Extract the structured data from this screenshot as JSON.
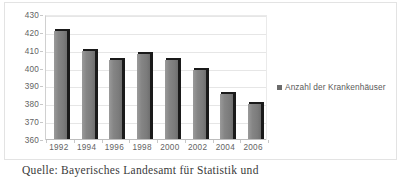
{
  "chart_data": {
    "type": "bar",
    "title": "",
    "xlabel": "",
    "ylabel": "",
    "categories": [
      "1992",
      "1994",
      "1996",
      "1998",
      "2000",
      "2002",
      "2004",
      "2006"
    ],
    "values": [
      421,
      410,
      405,
      408,
      405,
      399,
      386,
      380
    ],
    "series": [
      {
        "name": "Anzahl der Krankenhäuser",
        "values": [
          421,
          410,
          405,
          408,
          405,
          399,
          386,
          380
        ],
        "color": "#7b7b7b"
      }
    ],
    "ylim": [
      360,
      430
    ],
    "y_ticks": [
      360,
      370,
      380,
      390,
      400,
      410,
      420,
      430
    ],
    "grid": true,
    "legend_position": "right",
    "legend_entries": [
      "Anzahl der Krankenhäuser"
    ]
  },
  "legend": {
    "label": "Anzahl der Krankenhäuser",
    "marker": "legend-square-marker",
    "marker_color": "#6b6b6b"
  },
  "caption": {
    "source_text": "Quelle: Bayerisches Landesamt für Statistik und"
  },
  "colors": {
    "bar_fill": "#7b7b7b",
    "bar_shadow": "#1a1a1a",
    "gridline": "#e6e6e6",
    "axis": "#bdbdbd",
    "frame_border": "#e3e3e3",
    "text": "#5a5a5a",
    "background": "#ffffff"
  }
}
